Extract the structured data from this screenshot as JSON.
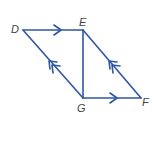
{
  "diagram": {
    "type": "parallelogram",
    "line_color": "#2f55a4",
    "label_color": "#444444",
    "vertices": {
      "D": {
        "label": "D",
        "x": 23,
        "y": 30
      },
      "E": {
        "label": "E",
        "x": 83,
        "y": 30
      },
      "F": {
        "label": "F",
        "x": 141,
        "y": 98
      },
      "G": {
        "label": "G",
        "x": 83,
        "y": 98
      }
    },
    "segments": [
      {
        "from": "D",
        "to": "E",
        "mark": "single-arrow"
      },
      {
        "from": "G",
        "to": "F",
        "mark": "single-arrow"
      },
      {
        "from": "G",
        "to": "D",
        "mark": "double-arrow"
      },
      {
        "from": "F",
        "to": "E",
        "mark": "double-arrow"
      },
      {
        "from": "E",
        "to": "G",
        "mark": "none"
      }
    ]
  }
}
